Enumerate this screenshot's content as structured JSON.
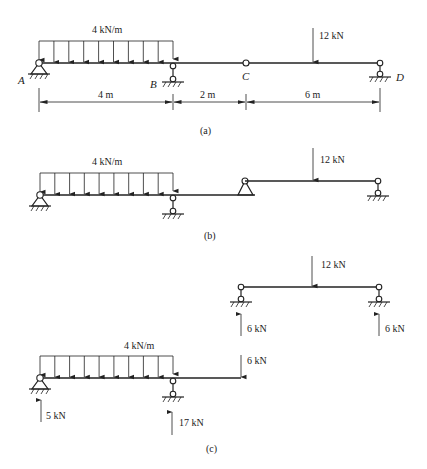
{
  "figure_a": {
    "caption": "(a)",
    "distributed_load": "4 kN/m",
    "point_load": "12 kN",
    "points": {
      "A": "A",
      "B": "B",
      "C": "C",
      "D": "D"
    },
    "dimensions": [
      "4 m",
      "2 m",
      "6 m"
    ]
  },
  "figure_b": {
    "caption": "(b)",
    "distributed_load": "4 kN/m",
    "point_load": "12 kN"
  },
  "figure_c": {
    "caption": "(c)",
    "upper": {
      "point_load": "12 kN",
      "left_reaction": "6 kN",
      "right_reaction": "6 kN"
    },
    "lower": {
      "distributed_load": "4 kN/m",
      "end_load": "6 kN",
      "reaction_A": "5 kN",
      "reaction_B": "17 kN"
    }
  }
}
